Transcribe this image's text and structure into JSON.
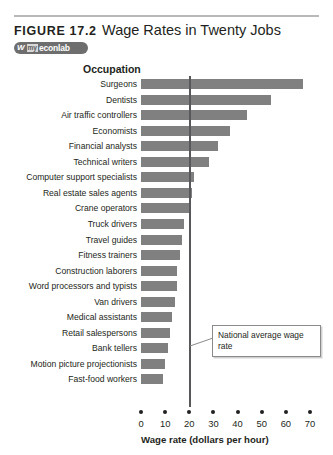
{
  "figure": {
    "label": "FIGURE 17.2",
    "title": "Wage Rates in Twenty Jobs",
    "badge": {
      "mark": "W",
      "prefix": "my",
      "name": "econlab"
    }
  },
  "annotation": {
    "text": "National average wage rate",
    "value": 20
  },
  "colors": {
    "bar": "#808080",
    "average_line": "#58585a",
    "text": "#231f20",
    "rule": "#b9b9b9",
    "badge": "#6e6e6e"
  },
  "chart_data": {
    "type": "bar",
    "orientation": "horizontal",
    "title": "Wage Rates in Twenty Jobs",
    "xlabel": "Wage rate (dollars per hour)",
    "ylabel": "Occupation",
    "xlim": [
      0,
      70
    ],
    "xticks": [
      0,
      10,
      20,
      30,
      40,
      50,
      60,
      70
    ],
    "grid": false,
    "legend": null,
    "annotations": [
      {
        "text": "National average wage rate",
        "type": "vertical-line",
        "x": 20
      }
    ],
    "categories": [
      "Surgeons",
      "Dentists",
      "Air traffic controllers",
      "Economists",
      "Financial analysts",
      "Technical writers",
      "Computer support specialists",
      "Real estate sales agents",
      "Crane operators",
      "Truck drivers",
      "Travel guides",
      "Fitness trainers",
      "Construction laborers",
      "Word processors and typists",
      "Van drivers",
      "Medical assistants",
      "Retail salespersons",
      "Bank tellers",
      "Motion picture projectionists",
      "Fast-food workers"
    ],
    "values": [
      67,
      54,
      44,
      37,
      32,
      28,
      22,
      21,
      20,
      18,
      17,
      16,
      15,
      15,
      14,
      13,
      12,
      11,
      10,
      9
    ]
  }
}
